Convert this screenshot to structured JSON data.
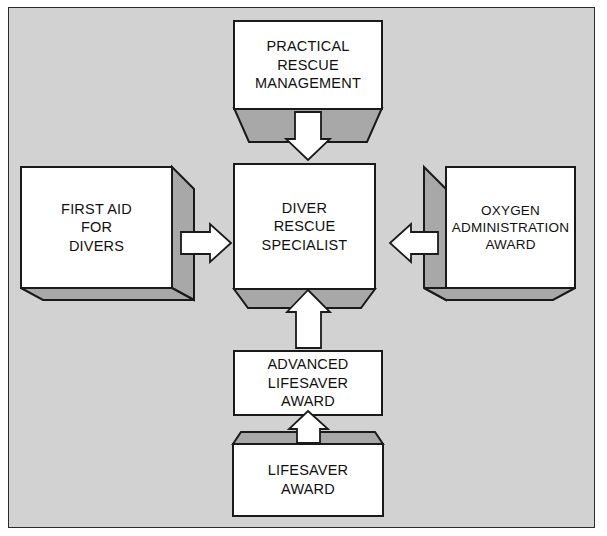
{
  "diagram": {
    "background_color": "#d2d2d2",
    "page_color": "#ffffff",
    "box_fill_color": "#ffffff",
    "shadow_fill_color": "#a8a8a8",
    "line_color": "#1a1a1a",
    "arrow_fill_color": "#ffffff"
  },
  "nodes": {
    "practical_rescue_management": {
      "id": "practical-rescue-management",
      "lines": [
        "PRACTICAL",
        "RESCUE",
        "MANAGEMENT"
      ],
      "style": "box-with-bottom-trapezoid-shadow",
      "position": "top"
    },
    "first_aid_for_divers": {
      "id": "first-aid-for-divers",
      "lines": [
        "FIRST AID",
        "FOR",
        "DIVERS"
      ],
      "style": "box-with-right-and-bottom-3d-shadow",
      "position": "left"
    },
    "diver_rescue_specialist": {
      "id": "diver-rescue-specialist",
      "lines": [
        "DIVER",
        "RESCUE",
        "SPECIALIST"
      ],
      "style": "box-with-bottom-trapezoid-shadow",
      "position": "center"
    },
    "oxygen_administration_award": {
      "id": "oxygen-administration-award",
      "lines": [
        "OXYGEN",
        "ADMINISTRATION",
        "AWARD"
      ],
      "style": "box-with-left-and-bottom-3d-shadow",
      "position": "right"
    },
    "advanced_lifesaver_award": {
      "id": "advanced-lifesaver-award",
      "lines": [
        "ADVANCED",
        "LIFESAVER",
        "AWARD"
      ],
      "style": "plain-box",
      "position": "bottom-middle"
    },
    "lifesaver_award": {
      "id": "lifesaver-award",
      "lines": [
        "LIFESAVER",
        "AWARD"
      ],
      "style": "box-with-top-trapezoid-shadow",
      "position": "bottom"
    }
  },
  "arrows": [
    {
      "id": "arrow-practical-rescue-to-center",
      "direction": "down",
      "from": "practical_rescue_management",
      "to": "diver_rescue_specialist"
    },
    {
      "id": "arrow-first-aid-to-center",
      "direction": "right",
      "from": "first_aid_for_divers",
      "to": "diver_rescue_specialist"
    },
    {
      "id": "arrow-oxygen-to-center",
      "direction": "left",
      "from": "oxygen_administration_award",
      "to": "diver_rescue_specialist"
    },
    {
      "id": "arrow-advanced-lifesaver-to-center",
      "direction": "up",
      "from": "advanced_lifesaver_award",
      "to": "diver_rescue_specialist"
    },
    {
      "id": "arrow-lifesaver-to-advanced",
      "direction": "up",
      "from": "lifesaver_award",
      "to": "advanced_lifesaver_award"
    }
  ]
}
